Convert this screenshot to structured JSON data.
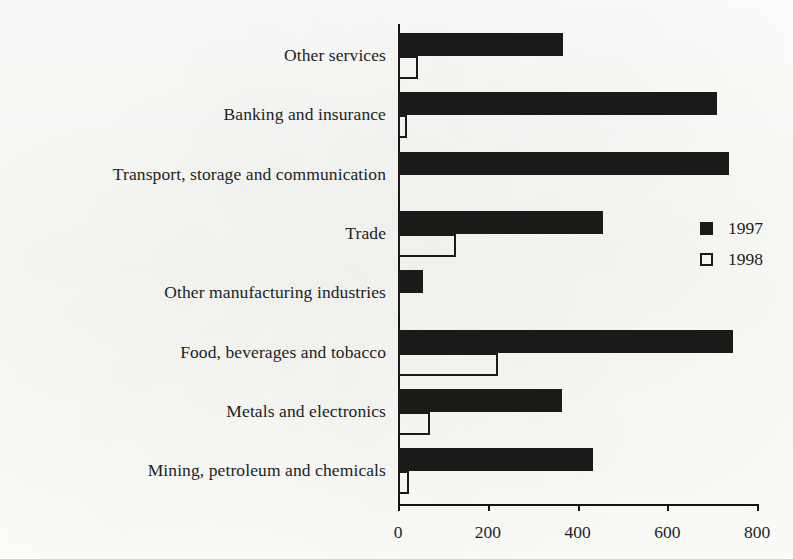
{
  "chart_data": {
    "type": "bar",
    "orientation": "horizontal",
    "title": "",
    "subtitle": "",
    "xlabel": "",
    "ylabel": "",
    "xlim": [
      0,
      800
    ],
    "xticks": [
      0,
      200,
      400,
      600,
      800
    ],
    "xtick_labels": [
      "0",
      "200",
      "400",
      "600",
      "800"
    ],
    "grid": false,
    "legend_position": "right-middle",
    "categories": [
      "Other services",
      "Banking and insurance",
      "Transport, storage and communication",
      "Trade",
      "Other manufacturing industries",
      "Food, beverages and tobacco",
      "Metals and electronics",
      "Mining, petroleum and chemicals"
    ],
    "series": [
      {
        "name": "1997",
        "style": "filled",
        "color": "#1b1a19",
        "values": [
          367,
          710,
          737,
          456,
          56,
          746,
          365,
          434
        ]
      },
      {
        "name": "1998",
        "style": "hollow",
        "color": "#1b1a19",
        "values": [
          45,
          20,
          2,
          129,
          5,
          223,
          71,
          25
        ]
      }
    ]
  },
  "legend": {
    "entries": [
      {
        "label": "1997",
        "swatch": "filled-square"
      },
      {
        "label": "1998",
        "swatch": "hollow-square"
      }
    ]
  },
  "axis": {
    "x_tick_labels": [
      "0",
      "200",
      "400",
      "600",
      "800"
    ]
  }
}
